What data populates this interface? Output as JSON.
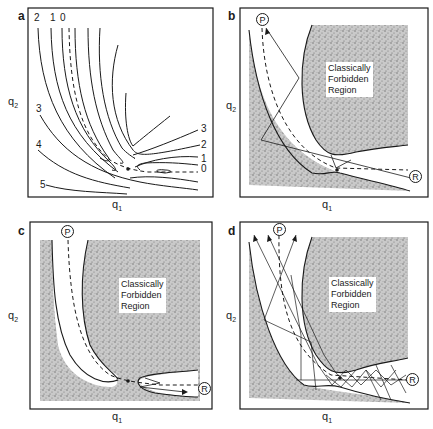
{
  "figure": {
    "panels": [
      {
        "id": "a",
        "letter": "a",
        "xlabel": "q",
        "xlabel_sub": "1",
        "ylabel": "q",
        "ylabel_sub": "2",
        "contour_labels_top": [
          "2",
          "1",
          "0"
        ],
        "contour_labels_left": [
          "3",
          "4",
          "5"
        ],
        "contour_labels_right": [
          "3",
          "2",
          "1",
          "0"
        ]
      },
      {
        "id": "b",
        "letter": "b",
        "xlabel": "q",
        "xlabel_sub": "1",
        "ylabel": "q",
        "ylabel_sub": "2",
        "region_text": [
          "Classically",
          "Forbidden",
          "Region"
        ],
        "product_marker": "P",
        "reactant_marker": "R"
      },
      {
        "id": "c",
        "letter": "c",
        "xlabel": "q",
        "xlabel_sub": "1",
        "ylabel": "q",
        "ylabel_sub": "2",
        "region_text": [
          "Classically",
          "Forbidden",
          "Region"
        ],
        "product_marker": "P",
        "reactant_marker": "R"
      },
      {
        "id": "d",
        "letter": "d",
        "xlabel": "q",
        "xlabel_sub": "1",
        "ylabel": "q",
        "ylabel_sub": "2",
        "region_text": [
          "Classically",
          "Forbidden",
          "Region"
        ],
        "product_marker": "P",
        "reactant_marker": "R"
      }
    ],
    "colors": {
      "ink": "#1a1a1a",
      "stipple": "#8c8c8c",
      "background": "#ffffff"
    }
  }
}
